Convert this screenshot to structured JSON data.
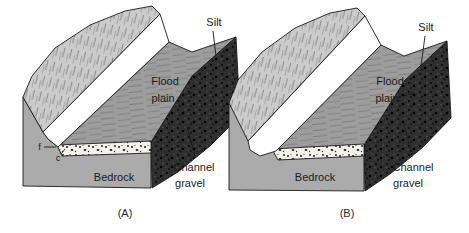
{
  "figure": {
    "background": "#ffffff",
    "colors": {
      "valley_wall": "#cbcbcb",
      "flood_plain": "#9d9d9d",
      "bedrock": "#ababab",
      "cross_section_face": "#2f2f2f",
      "channel": "#ffffff",
      "gravel_band": "#f2f1ec",
      "outline": "#1a1a1a"
    },
    "panels": [
      {
        "caption": "(A)",
        "labels": {
          "silt": "Silt",
          "flood_plain": [
            "Flood",
            "plain"
          ],
          "bedrock": "Bedrock",
          "channel_gravel": [
            "Channel",
            "gravel"
          ],
          "point_f": "f",
          "point_c": "c"
        }
      },
      {
        "caption": "(B)",
        "labels": {
          "silt": "Silt",
          "flood_plain": [
            "Flood",
            "plain"
          ],
          "bedrock": "Bedrock",
          "channel_gravel": [
            "Channel",
            "gravel"
          ]
        }
      }
    ]
  }
}
